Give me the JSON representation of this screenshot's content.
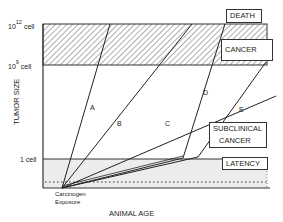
{
  "diagram": {
    "y_axis": {
      "label": "TUMOR SIZE",
      "ticks": [
        {
          "base": "10",
          "exp": "12",
          "unit": "cell"
        },
        {
          "base": "10",
          "exp": "9",
          "unit": "cell"
        },
        {
          "base": "",
          "exp": "",
          "unit": "1 cell"
        }
      ]
    },
    "x_axis": {
      "label": "ANIMAL AGE"
    },
    "origin_label": [
      "Carcinogen",
      "Exposure"
    ],
    "zones": {
      "death": "DEATH",
      "cancer": "CANCER",
      "subclinical": [
        "SUBCLINICAL",
        "CANCER"
      ],
      "latency": "LATENCY"
    },
    "curves": [
      "A",
      "B",
      "C",
      "D",
      "E"
    ]
  }
}
